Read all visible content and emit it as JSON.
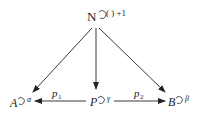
{
  "nodes": {
    "N": {
      "label": "N",
      "loop_label": "( ) +1"
    },
    "A": {
      "label": "A",
      "loop_label": "α"
    },
    "P": {
      "label": "P",
      "loop_label": "γ"
    },
    "B": {
      "label": "B",
      "loop_label": "β"
    }
  },
  "edges": {
    "p1": {
      "label": "p",
      "sub": "1"
    },
    "p2": {
      "label": "p",
      "sub": "2"
    }
  },
  "colors": {
    "stroke": "#222222"
  }
}
